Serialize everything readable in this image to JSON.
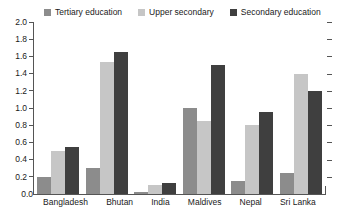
{
  "chart_data": {
    "type": "bar",
    "title": "",
    "xlabel": "",
    "ylabel": "",
    "ylim": [
      0.0,
      2.0
    ],
    "ytick_labels": [
      "2.0",
      "1.8",
      "1.6",
      "1.4",
      "1.2",
      "1.0",
      "0.8",
      "0.6",
      "0.4",
      "0.2",
      "0.0"
    ],
    "ytick_values": [
      2.0,
      1.8,
      1.6,
      1.4,
      1.2,
      1.0,
      0.8,
      0.6,
      0.4,
      0.2,
      0.0
    ],
    "grid": false,
    "legend_position": "top",
    "categories": [
      "Bangladesh",
      "Bhutan",
      "India",
      "Maldives",
      "Nepal",
      "Sri Lanka"
    ],
    "series": [
      {
        "name": "Tertiary education",
        "color": "#8c8c8c",
        "values": [
          0.2,
          0.3,
          0.02,
          1.0,
          0.15,
          0.25
        ]
      },
      {
        "name": "Upper secondary",
        "color": "#c6c6c6",
        "values": [
          0.5,
          1.53,
          0.1,
          0.85,
          0.8,
          1.4
        ]
      },
      {
        "name": "Secondary education",
        "color": "#3f3f3f",
        "values": [
          0.55,
          1.65,
          0.13,
          1.5,
          0.95,
          1.2
        ]
      }
    ]
  }
}
